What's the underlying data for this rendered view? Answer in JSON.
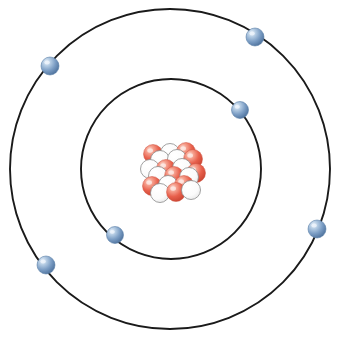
{
  "figure": {
    "caption": "",
    "background_color": "#ffffff",
    "width": 340,
    "height": 338
  },
  "colors": {
    "orbit_stroke": "#1a1a1a",
    "electron_fill": "#7b9dc4",
    "electron_fill_dark": "#4d719c",
    "electron_highlight": "#eef4fb",
    "electron_outline": "#5a7fa8",
    "proton_fill": "#e8604c",
    "proton_fill_dark": "#c6412f",
    "proton_highlight": "#fde6e0",
    "proton_outline": "#cf5340",
    "neutron_fill": "#ffffff",
    "neutron_outline": "#8a8a8a",
    "neutron_shade": "#e8e8e8"
  },
  "nucleus": {
    "label": "nucleus",
    "center_x": 171,
    "center_y": 171,
    "proton_count": 9,
    "neutron_count": 10,
    "particle_radius": 9.5,
    "particles": [
      {
        "type": "proton",
        "x": 153,
        "y": 154
      },
      {
        "type": "neutron",
        "x": 170,
        "y": 153
      },
      {
        "type": "proton",
        "x": 186,
        "y": 152
      },
      {
        "type": "neutron",
        "x": 160,
        "y": 160
      },
      {
        "type": "neutron",
        "x": 177,
        "y": 159
      },
      {
        "type": "proton",
        "x": 193,
        "y": 159
      },
      {
        "type": "neutron",
        "x": 150,
        "y": 169
      },
      {
        "type": "proton",
        "x": 166,
        "y": 169
      },
      {
        "type": "neutron",
        "x": 182,
        "y": 168
      },
      {
        "type": "proton",
        "x": 196,
        "y": 173
      },
      {
        "type": "neutron",
        "x": 158,
        "y": 176
      },
      {
        "type": "proton",
        "x": 174,
        "y": 176
      },
      {
        "type": "neutron",
        "x": 189,
        "y": 177
      },
      {
        "type": "proton",
        "x": 152,
        "y": 186
      },
      {
        "type": "neutron",
        "x": 168,
        "y": 185
      },
      {
        "type": "proton",
        "x": 184,
        "y": 185
      },
      {
        "type": "neutron",
        "x": 160,
        "y": 193
      },
      {
        "type": "proton",
        "x": 176,
        "y": 192
      },
      {
        "type": "neutron",
        "x": 191,
        "y": 190
      }
    ]
  },
  "shells": [
    {
      "name": "inner-shell",
      "label": "K shell",
      "center_x": 171,
      "center_y": 169,
      "radius": 90,
      "electron_count": 2,
      "electrons": [
        {
          "label": "electron-inner-right",
          "x": 240,
          "y": 110,
          "r": 8.5
        },
        {
          "label": "electron-inner-lower-left",
          "x": 115,
          "y": 235,
          "r": 8.5
        }
      ]
    },
    {
      "name": "outer-shell",
      "label": "L shell",
      "center_x": 170,
      "center_y": 169,
      "radius": 160,
      "electron_count": 4,
      "electrons": [
        {
          "label": "electron-outer-upper-left",
          "x": 50,
          "y": 66,
          "r": 9
        },
        {
          "label": "electron-outer-upper-right",
          "x": 255,
          "y": 37,
          "r": 9
        },
        {
          "label": "electron-outer-right",
          "x": 317,
          "y": 229,
          "r": 9
        },
        {
          "label": "electron-outer-lower-left",
          "x": 46,
          "y": 265,
          "r": 9
        }
      ]
    }
  ]
}
